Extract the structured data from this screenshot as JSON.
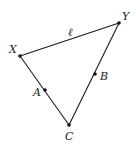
{
  "diagram": {
    "type": "triangle",
    "points": {
      "X": {
        "label": "X",
        "x": 20,
        "y": 56,
        "label_x": 9,
        "label_y": 53
      },
      "Y": {
        "label": "Y",
        "x": 119,
        "y": 23,
        "label_x": 122,
        "label_y": 20
      },
      "C": {
        "label": "C",
        "x": 69,
        "y": 125,
        "label_x": 65,
        "label_y": 140
      },
      "A": {
        "label": "A",
        "x": 45,
        "y": 90,
        "label_x": 33,
        "label_y": 96
      },
      "B": {
        "label": "B",
        "x": 95,
        "y": 74,
        "label_x": 100,
        "label_y": 80
      }
    },
    "edges": [
      {
        "from": "X",
        "to": "Y",
        "label": "ℓ"
      },
      {
        "from": "X",
        "to": "C"
      },
      {
        "from": "Y",
        "to": "C"
      }
    ],
    "line_label": {
      "text": "ℓ",
      "x": 68,
      "y": 36
    },
    "colors": {
      "stroke": "#1a1a1a",
      "point": "#111111",
      "background": "#ffffff"
    }
  }
}
